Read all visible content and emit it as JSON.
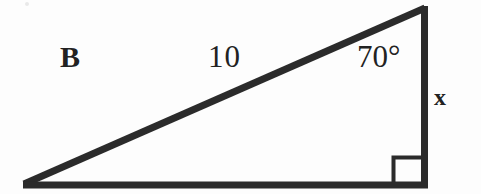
{
  "figure": {
    "type": "right-triangle-diagram",
    "background_color": "#fdfdfd",
    "stroke_color": "#2b2b2b",
    "text_color": "#222222",
    "labels": {
      "vertex_b": "B",
      "hypotenuse": "10",
      "angle": "70°",
      "opposite_side": "x"
    },
    "geometry": {
      "vertices": {
        "left": [
          23,
          185
        ],
        "top_right": [
          424,
          6
        ],
        "bottom_right": [
          424,
          185
        ]
      },
      "sides": [
        {
          "name": "hypotenuse",
          "from": "left",
          "to": "top_right",
          "label": "10",
          "thickness": 7
        },
        {
          "name": "base",
          "from": "left",
          "to": "bottom_right",
          "label": "",
          "thickness": 7
        },
        {
          "name": "vertical",
          "from": "top_right",
          "to": "bottom_right",
          "label": "x",
          "thickness": 7
        }
      ],
      "angles": [
        {
          "at": "top_right",
          "label": "70°",
          "measure_degrees": 70
        },
        {
          "at": "bottom_right",
          "label": "",
          "measure_degrees": 90,
          "marker": "right-angle-square"
        },
        {
          "at": "left",
          "label": "B",
          "measure_degrees": 20
        }
      ],
      "right_angle_marker": {
        "x": 392,
        "y": 156,
        "width": 30,
        "height": 29
      }
    }
  }
}
